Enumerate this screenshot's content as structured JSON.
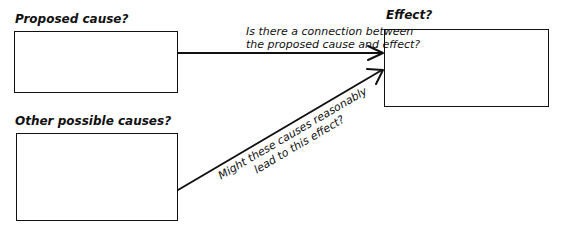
{
  "diagram": {
    "nodes": {
      "proposed_cause": {
        "label": "Proposed cause?"
      },
      "other_causes": {
        "label": "Other possible causes?"
      },
      "effect": {
        "label": "Effect?"
      }
    },
    "edges": {
      "proposed_to_effect": {
        "line1": "Is there a connection between",
        "line2": "the proposed cause and effect?"
      },
      "other_to_effect": {
        "line1": "Might these causes reasonably",
        "line2": "lead to this effect?"
      }
    },
    "colors": {
      "stroke": "#111111",
      "background": "#ffffff"
    }
  }
}
